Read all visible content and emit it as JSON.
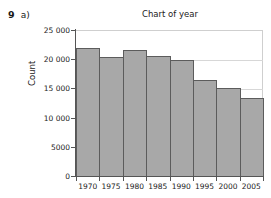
{
  "exercise": {
    "number": "9",
    "part": "a)"
  },
  "chart_data": {
    "type": "bar",
    "title": "Chart of year",
    "xlabel": "",
    "ylabel": "Count",
    "categories": [
      "1970",
      "1975",
      "1980",
      "1985",
      "1990",
      "1995",
      "2000",
      "2005"
    ],
    "values": [
      22000,
      20400,
      21600,
      20500,
      19900,
      16400,
      15000,
      13400
    ],
    "ylim": [
      0,
      25000
    ],
    "ytick_values": [
      0,
      5000,
      10000,
      15000,
      20000,
      25000
    ],
    "ytick_labels": [
      "0",
      "5000",
      "10 000",
      "15 000",
      "20 000",
      "25 000"
    ],
    "xtick_labels": [
      "1970",
      "1975",
      "1980",
      "1985",
      "1990",
      "1995",
      "2000",
      "2005"
    ],
    "grid": true,
    "legend": null,
    "bar_fill_color": "#a8a8a8",
    "bar_edge_color": "#5c5c5c",
    "gridline_color": "#d7d7d7",
    "axis_color": "#555555"
  }
}
